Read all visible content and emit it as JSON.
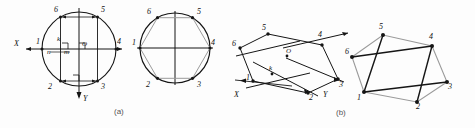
{
  "figure": {
    "captions": [
      {
        "id": "caption-a",
        "text": "(a)",
        "x": 114,
        "y": 107
      },
      {
        "id": "caption-b",
        "text": "(b)",
        "x": 336,
        "y": 108
      }
    ],
    "colors": {
      "ink": "#151515",
      "light_ink": "#9a9a9a",
      "paper": "#fdfdfd",
      "caption": "#555555"
    }
  },
  "panels": [
    {
      "name": "circle-construction-left",
      "type": "circle",
      "center": {
        "x": 79,
        "y": 49
      },
      "radius": 37,
      "axes": {
        "x_label": "X",
        "y_label": "Y",
        "origin_label": "O",
        "x_label_pos": {
          "x": 16,
          "y": 43
        },
        "y_label_pos": {
          "x": 82,
          "y": 99
        },
        "origin_label_pos": {
          "x": 83,
          "y": 44
        }
      },
      "aux_labels": [
        {
          "text": "k",
          "x": 58,
          "y": 40
        },
        {
          "text": "n",
          "x": 49,
          "y": 52
        },
        {
          "text": "m",
          "x": 66,
          "y": 52
        }
      ],
      "vertices": [
        {
          "id": "1",
          "angle": 180,
          "label_x": 36,
          "label_y": 42
        },
        {
          "id": "2",
          "angle": 120,
          "label_x": 48,
          "label_y": 88
        },
        {
          "id": "3",
          "angle": 60,
          "label_x": 105,
          "label_y": 88
        },
        {
          "id": "4",
          "angle": 0,
          "label_x": 117,
          "label_y": 42
        },
        {
          "id": "5",
          "angle": -60,
          "label_x": 104,
          "label_y": 11
        },
        {
          "id": "6",
          "angle": -120,
          "label_x": 50,
          "label_y": 11
        }
      ]
    },
    {
      "name": "circle-hexagon-right",
      "type": "circle",
      "center": {
        "x": 175,
        "y": 48
      },
      "radius": 35,
      "vertices": [
        {
          "id": "1",
          "angle": 180,
          "label_x": 133,
          "label_y": 42
        },
        {
          "id": "2",
          "angle": 120,
          "label_x": 146,
          "label_y": 87
        },
        {
          "id": "3",
          "angle": 60,
          "label_x": 200,
          "label_y": 87
        },
        {
          "id": "4",
          "angle": 0,
          "label_x": 212,
          "label_y": 42
        },
        {
          "id": "5",
          "angle": -60,
          "label_x": 199,
          "label_y": 12
        },
        {
          "id": "6",
          "angle": -120,
          "label_x": 148,
          "label_y": 12
        }
      ]
    },
    {
      "name": "oblique-projection-a",
      "type": "oblique",
      "axes": {
        "x_label": "X",
        "y_label": "Y",
        "origin_label": "O",
        "aux_label": "k"
      },
      "points": [
        {
          "id": "1",
          "x": 253,
          "y": 81,
          "label_x": 248,
          "label_y": 76
        },
        {
          "id": "2",
          "x": 308,
          "y": 93,
          "label_x": 310,
          "label_y": 98
        },
        {
          "id": "3",
          "x": 338,
          "y": 79,
          "label_x": 339,
          "label_y": 86
        },
        {
          "id": "4",
          "x": 322,
          "y": 45,
          "label_x": 319,
          "label_y": 36
        },
        {
          "id": "5",
          "x": 268,
          "y": 34,
          "label_x": 263,
          "label_y": 28
        },
        {
          "id": "6",
          "x": 238,
          "y": 48,
          "label_x": 235,
          "label_y": 44
        }
      ],
      "labels": [
        {
          "text": "O",
          "x": 287,
          "y": 58
        },
        {
          "text": "k",
          "x": 271,
          "y": 71
        },
        {
          "text": "1",
          "x": 246,
          "y": 80
        },
        {
          "text": "X",
          "x": 238,
          "y": 96
        },
        {
          "text": "Y",
          "x": 325,
          "y": 97
        }
      ]
    },
    {
      "name": "oblique-hexagon-b",
      "type": "oblique-hexagon",
      "points": [
        {
          "id": "1",
          "x": 364,
          "y": 92,
          "label_x": 358,
          "label_y": 99
        },
        {
          "id": "2",
          "x": 417,
          "y": 102,
          "label_x": 417,
          "label_y": 108
        },
        {
          "id": "3",
          "x": 447,
          "y": 82,
          "label_x": 448,
          "label_y": 88
        },
        {
          "id": "4",
          "x": 432,
          "y": 46,
          "label_x": 430,
          "label_y": 38
        },
        {
          "id": "5",
          "x": 383,
          "y": 35,
          "label_x": 380,
          "label_y": 28
        },
        {
          "id": "6",
          "x": 352,
          "y": 57,
          "label_x": 346,
          "label_y": 52
        }
      ]
    }
  ]
}
